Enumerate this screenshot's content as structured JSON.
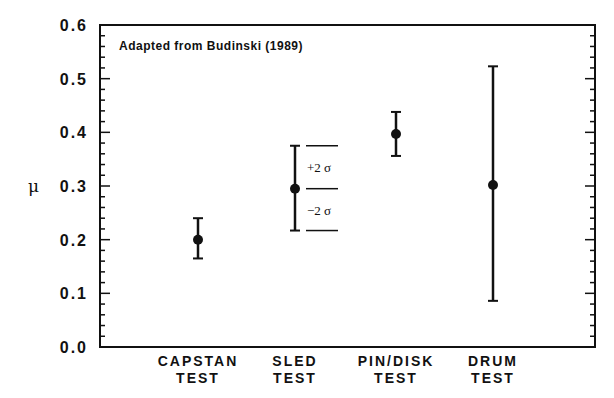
{
  "chart_data": {
    "type": "scatter",
    "title": "",
    "annotation": "Adapted from Budinski (1989)",
    "xlabel": "",
    "ylabel": "μ",
    "ylim": [
      0.0,
      0.6
    ],
    "yticks": [
      "0.0",
      "0.1",
      "0.2",
      "0.3",
      "0.4",
      "0.5",
      "0.6"
    ],
    "grid": false,
    "legend": null,
    "categories": [
      {
        "line1": "CAPSTAN",
        "line2": "TEST"
      },
      {
        "line1": "SLED",
        "line2": "TEST"
      },
      {
        "line1": "PIN/DISK",
        "line2": "TEST"
      },
      {
        "line1": "DRUM",
        "line2": "TEST"
      }
    ],
    "series": [
      {
        "name": "Coefficient of friction (mean ± 2σ)",
        "points": [
          {
            "category": "CAPSTAN TEST",
            "mean": 0.2,
            "upper": 0.24,
            "lower": 0.165
          },
          {
            "category": "SLED TEST",
            "mean": 0.295,
            "upper": 0.375,
            "lower": 0.217
          },
          {
            "category": "PIN/DISK TEST",
            "mean": 0.397,
            "upper": 0.438,
            "lower": 0.356
          },
          {
            "category": "DRUM TEST",
            "mean": 0.302,
            "upper": 0.523,
            "lower": 0.086
          }
        ]
      }
    ],
    "sigma_labels": {
      "plus": "+2 σ",
      "minus": "−2 σ"
    }
  }
}
